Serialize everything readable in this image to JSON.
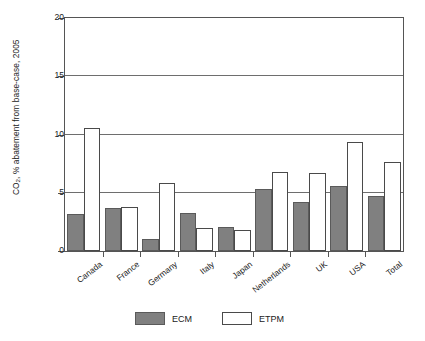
{
  "chart_data": {
    "type": "bar",
    "title": "",
    "xlabel": "",
    "ylabel": "CO2, % abatement from base-case, 2005",
    "ylabel_prefix": "CO",
    "ylabel_subscript": "2",
    "ylabel_suffix": ", % abatement from base-case, 2005",
    "categories": [
      "Canada",
      "France",
      "Germany",
      "Italy",
      "Japan",
      "Netherlands",
      "UK",
      "USA",
      "Total"
    ],
    "series": [
      {
        "name": "ECM",
        "values": [
          3.2,
          3.7,
          1.0,
          3.3,
          2.1,
          5.3,
          4.2,
          5.6,
          4.7
        ]
      },
      {
        "name": "ETPM",
        "values": [
          10.6,
          3.8,
          5.8,
          2.0,
          1.8,
          6.8,
          6.7,
          9.4,
          7.6
        ]
      }
    ],
    "ylim": [
      0,
      20
    ],
    "yticks": [
      0,
      5,
      10,
      15,
      20
    ],
    "ytick_labels": [
      "0",
      "5",
      "10",
      "15",
      "20"
    ],
    "grid": "horizontal",
    "legend_position": "bottom-center",
    "colors": {
      "ECM": "#808080",
      "ETPM": "#ffffff",
      "axis": "#555555",
      "grid": "#6e6e6e"
    }
  },
  "legend": {
    "items": [
      {
        "label": "ECM",
        "style": "filled-gray"
      },
      {
        "label": "ETPM",
        "style": "outlined-white"
      }
    ]
  }
}
